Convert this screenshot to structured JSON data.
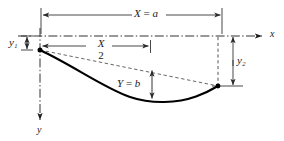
{
  "figure": {
    "kind": "engineering-dimension-diagram",
    "background_color": "#ffffff",
    "ink_color": "#1a1a1a",
    "curve_color": "#000000",
    "axis_color": "#333333",
    "dimension_color": "#333333"
  },
  "labels": {
    "span": {
      "text": "X = a",
      "var": "X",
      "equals": " = ",
      "value": "a"
    },
    "half_span": {
      "numerator": "X",
      "denominator": "2"
    },
    "sag": {
      "text": "Y = b",
      "var": "Y",
      "equals": " = ",
      "value": "b"
    },
    "left_elevation": {
      "base": "y",
      "sub": "1"
    },
    "right_elevation": {
      "base": "y",
      "sub": "2"
    },
    "x_axis": "x",
    "y_axis": "y"
  },
  "geometry": {
    "x_axis_y": 36,
    "left_support_x": 40,
    "right_support_x": 218,
    "left_support_y": 50,
    "right_support_y": 86,
    "curve_lowest_y": 101,
    "span_dim_line_y": 15,
    "span_dim_left_x": 42,
    "span_dim_right_x": 222,
    "half_span_dim_line_y": 46,
    "half_span_left_x": 41,
    "half_span_right_x": 150,
    "sag_arrow_x": 152,
    "sag_arrow_top_y": 70,
    "sag_arrow_bottom_y": 99,
    "y2_arrow_x": 233,
    "y2_arrow_top_y": 36,
    "y2_arrow_bottom_y": 86,
    "y1_arrow_x": 27,
    "y1_arrow_top_y": 36,
    "y1_arrow_bottom_y": 50,
    "y_axis_x": 40,
    "y_axis_top_y": 36,
    "y_axis_bottom_y": 122,
    "x_axis_right_end": 268
  }
}
